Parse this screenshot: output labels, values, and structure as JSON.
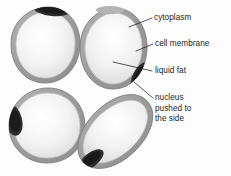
{
  "figure": {
    "kind": "biology-diagram",
    "background_color": "#fdfdfd",
    "line_color": "#1d1d1d",
    "membrane_color": "#9b9b9b",
    "membrane_inner_color": "#c9c9c9",
    "cytoplasm_color": "#e6e6e6",
    "fat_color": "#f4f4f4",
    "nucleus_color": "#262626"
  },
  "labels": {
    "cytoplasm": "cytoplasm",
    "cell_membrane": "cell membrane",
    "liquid_fat": "liquid fat",
    "nucleus_line1": "nucleus",
    "nucleus_line2": "pushed to",
    "nucleus_line3": "the side"
  },
  "cells": [
    {
      "id": "cell-top-left",
      "shape": "round",
      "nucleus_position": "top edge"
    },
    {
      "id": "cell-top-right",
      "shape": "round",
      "nucleus_position": "lower-right edge"
    },
    {
      "id": "cell-bottom-left",
      "shape": "round",
      "nucleus_position": "left edge"
    },
    {
      "id": "cell-bottom-right",
      "shape": "tilted oval",
      "nucleus_position": "bottom-left edge"
    }
  ]
}
